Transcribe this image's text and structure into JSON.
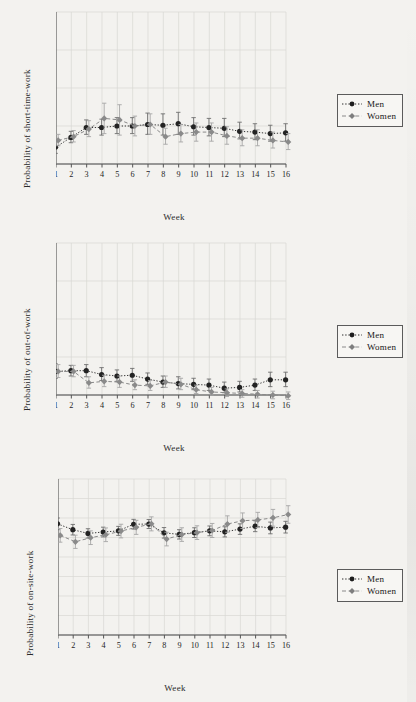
{
  "figure": {
    "background": "#f3f2ef",
    "ink": "#1a1a1a",
    "men_color": "#2b2b2b",
    "women_color": "#8a8a8a",
    "grid_color": "#d8d8d4"
  },
  "legend": {
    "men_label": "Men",
    "women_label": "Women",
    "men_marker": "circle-marker",
    "women_marker": "diamond-marker"
  },
  "charts": [
    {
      "id": "short-time-work",
      "ylabel": "Probability of short-time-work",
      "xlabel": "Week"
    },
    {
      "id": "out-of-work",
      "ylabel": "Probability of out-of-work",
      "xlabel": "Week"
    },
    {
      "id": "on-site-work",
      "ylabel": "Probability of on-site-work",
      "xlabel": "Week"
    }
  ],
  "chart_data": [
    {
      "type": "line",
      "title": "",
      "xlabel": "Week",
      "ylabel": "Probability of short-time-work",
      "x": [
        1,
        2,
        3,
        4,
        5,
        6,
        7,
        8,
        9,
        10,
        11,
        12,
        13,
        14,
        15,
        16
      ],
      "xticklabels": [
        "1",
        "2",
        "3",
        "4",
        "5",
        "6",
        "7",
        "8",
        "9",
        "10",
        "11",
        "12",
        "13",
        "14",
        "15",
        "16"
      ],
      "yticks": [
        0,
        0.05,
        0.1,
        0.15,
        0.2
      ],
      "yticklabels": [
        "0",
        ".05",
        ".1",
        ".15",
        ".2"
      ],
      "ylim": [
        0,
        0.2
      ],
      "xlim": [
        1,
        16
      ],
      "grid": true,
      "legend_position": "outside-right",
      "series": [
        {
          "name": "Men",
          "marker": "circle",
          "linestyle": "dotted",
          "color": "#2b2b2b",
          "values": [
            0.022,
            0.035,
            0.048,
            0.048,
            0.05,
            0.05,
            0.052,
            0.051,
            0.053,
            0.049,
            0.048,
            0.047,
            0.043,
            0.042,
            0.04,
            0.041
          ],
          "err_low": [
            0.014,
            0.028,
            0.039,
            0.038,
            0.04,
            0.04,
            0.039,
            0.038,
            0.039,
            0.038,
            0.037,
            0.036,
            0.033,
            0.032,
            0.03,
            0.03
          ],
          "err_high": [
            0.031,
            0.043,
            0.058,
            0.059,
            0.061,
            0.061,
            0.067,
            0.066,
            0.068,
            0.061,
            0.06,
            0.06,
            0.055,
            0.053,
            0.051,
            0.053
          ]
        },
        {
          "name": "Women",
          "marker": "diamond",
          "linestyle": "dashed",
          "color": "#8a8a8a",
          "values": [
            0.031,
            0.036,
            0.046,
            0.06,
            0.058,
            0.05,
            0.052,
            0.036,
            0.04,
            0.042,
            0.042,
            0.037,
            0.034,
            0.034,
            0.031,
            0.029
          ],
          "err_low": [
            0.024,
            0.029,
            0.036,
            0.04,
            0.038,
            0.037,
            0.039,
            0.026,
            0.029,
            0.03,
            0.03,
            0.026,
            0.024,
            0.024,
            0.021,
            0.019
          ],
          "err_high": [
            0.039,
            0.044,
            0.057,
            0.08,
            0.078,
            0.063,
            0.066,
            0.047,
            0.052,
            0.054,
            0.054,
            0.049,
            0.045,
            0.045,
            0.042,
            0.04
          ]
        }
      ]
    },
    {
      "type": "line",
      "title": "",
      "xlabel": "Week",
      "ylabel": "Probability of out-of-work",
      "x": [
        1,
        2,
        3,
        4,
        5,
        6,
        7,
        8,
        9,
        10,
        11,
        12,
        13,
        14,
        15,
        16
      ],
      "xticklabels": [
        "1",
        "2",
        "3",
        "4",
        "5",
        "6",
        "7",
        "8",
        "9",
        "10",
        "11",
        "12",
        "13",
        "14",
        "15",
        "16"
      ],
      "yticks": [
        0,
        0.05,
        0.1,
        0.15,
        0.2
      ],
      "yticklabels": [
        "0",
        ".05",
        ".1",
        ".15",
        ".2"
      ],
      "ylim": [
        0,
        0.2
      ],
      "xlim": [
        1,
        16
      ],
      "grid": true,
      "legend_position": "outside-right",
      "series": [
        {
          "name": "Men",
          "marker": "circle",
          "linestyle": "dotted",
          "color": "#2b2b2b",
          "values": [
            0.031,
            0.032,
            0.032,
            0.027,
            0.025,
            0.026,
            0.021,
            0.017,
            0.015,
            0.014,
            0.013,
            0.009,
            0.01,
            0.013,
            0.02,
            0.02
          ],
          "err_low": [
            0.022,
            0.025,
            0.024,
            0.019,
            0.018,
            0.018,
            0.014,
            0.01,
            0.008,
            0.007,
            0.006,
            0.003,
            0.004,
            0.006,
            0.011,
            0.011
          ],
          "err_high": [
            0.041,
            0.039,
            0.04,
            0.036,
            0.033,
            0.035,
            0.029,
            0.025,
            0.024,
            0.022,
            0.021,
            0.017,
            0.018,
            0.021,
            0.03,
            0.03
          ]
        },
        {
          "name": "Women",
          "marker": "diamond",
          "linestyle": "dashed",
          "color": "#8a8a8a",
          "values": [
            0.031,
            0.031,
            0.016,
            0.018,
            0.017,
            0.013,
            0.012,
            0.017,
            0.014,
            0.007,
            0.004,
            0.003,
            0.002,
            0.001,
            0.0,
            -0.001
          ],
          "err_low": [
            0.023,
            0.024,
            0.009,
            0.011,
            0.01,
            0.007,
            0.006,
            0.01,
            0.007,
            0.002,
            0.0,
            -0.002,
            -0.003,
            -0.004,
            -0.005,
            -0.006
          ],
          "err_high": [
            0.04,
            0.039,
            0.024,
            0.026,
            0.025,
            0.02,
            0.019,
            0.025,
            0.022,
            0.013,
            0.01,
            0.008,
            0.007,
            0.006,
            0.005,
            0.004
          ]
        }
      ]
    },
    {
      "type": "line",
      "title": "",
      "xlabel": "Week",
      "ylabel": "Probability of on-site-work",
      "x": [
        1,
        2,
        3,
        4,
        5,
        6,
        7,
        8,
        9,
        10,
        11,
        12,
        13,
        14,
        15,
        16
      ],
      "xticklabels": [
        "1",
        "2",
        "3",
        "4",
        "5",
        "6",
        "7",
        "8",
        "9",
        "10",
        "11",
        "12",
        "13",
        "14",
        "15",
        "16"
      ],
      "yticks": [
        0,
        0.1,
        0.2,
        0.3,
        0.4,
        0.5,
        0.6,
        0.7,
        0.8
      ],
      "yticklabels": [
        "0",
        ".1",
        ".2",
        ".3",
        ".4",
        ".5",
        ".6",
        ".7",
        ".8"
      ],
      "ylim": [
        0,
        0.8
      ],
      "xlim": [
        1,
        16
      ],
      "grid": true,
      "legend_position": "outside-right",
      "series": [
        {
          "name": "Men",
          "marker": "circle",
          "linestyle": "dotted",
          "color": "#2b2b2b",
          "values": [
            0.57,
            0.54,
            0.521,
            0.528,
            0.534,
            0.568,
            0.569,
            0.524,
            0.516,
            0.525,
            0.534,
            0.529,
            0.543,
            0.558,
            0.549,
            0.553
          ],
          "err_low": [
            0.54,
            0.513,
            0.497,
            0.503,
            0.511,
            0.543,
            0.546,
            0.497,
            0.492,
            0.5,
            0.509,
            0.503,
            0.516,
            0.53,
            0.519,
            0.523
          ],
          "err_high": [
            0.6,
            0.567,
            0.545,
            0.553,
            0.557,
            0.593,
            0.592,
            0.551,
            0.54,
            0.55,
            0.559,
            0.555,
            0.57,
            0.586,
            0.579,
            0.583
          ]
        },
        {
          "name": "Women",
          "marker": "diamond",
          "linestyle": "dashed",
          "color": "#8a8a8a",
          "values": [
            0.511,
            0.478,
            0.499,
            0.514,
            0.533,
            0.552,
            0.57,
            0.492,
            0.515,
            0.525,
            0.536,
            0.569,
            0.586,
            0.59,
            0.601,
            0.618
          ],
          "err_low": [
            0.476,
            0.444,
            0.464,
            0.479,
            0.498,
            0.516,
            0.534,
            0.457,
            0.48,
            0.49,
            0.5,
            0.527,
            0.546,
            0.551,
            0.558,
            0.573
          ],
          "err_high": [
            0.546,
            0.512,
            0.534,
            0.549,
            0.568,
            0.588,
            0.606,
            0.527,
            0.55,
            0.56,
            0.572,
            0.611,
            0.626,
            0.629,
            0.644,
            0.663
          ]
        }
      ]
    }
  ]
}
